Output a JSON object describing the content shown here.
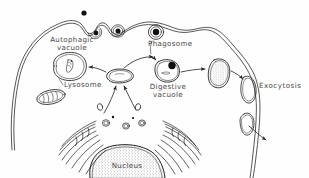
{
  "figure": {
    "kind": "hand-drawn biological diagram",
    "width": 309,
    "height": 178,
    "background_color": "#fefefe",
    "ink_color": "#1f1f1f"
  },
  "labels": {
    "autophagic_vacuole_line1": "Autophagic",
    "autophagic_vacuole_line2": "vacuole",
    "phagosome": "Phagosome",
    "lysosome": "Lysosome",
    "digestive_vacuole_line1": "Digestive",
    "digestive_vacuole_line2": "vacuole",
    "exocytosis": "Exocytosis",
    "nucleus": "Nucleus"
  },
  "structures": [
    {
      "name": "cell-membrane",
      "description": "irregular double-line plasma membrane bounding the cell"
    },
    {
      "name": "extracellular-particle",
      "description": "solid black dot outside the cell"
    },
    {
      "name": "membrane-invagination",
      "description": "membrane pocket enclosing a particle"
    },
    {
      "name": "pinching-vesicle",
      "description": "vesicle at the membrane containing a dark particle"
    },
    {
      "name": "phagosome-vesicle",
      "description": "internalized vesicle with dark particle"
    },
    {
      "name": "autophagic-vacuole",
      "description": "large oval vacuole enclosing a degraded organelle"
    },
    {
      "name": "mitochondrion",
      "description": "oval organelle with internal cristae"
    },
    {
      "name": "lysosome",
      "description": "small kidney-shaped central vesicle, hub of arrows"
    },
    {
      "name": "digestive-vacuole",
      "description": "vacuole containing a black particle being digested"
    },
    {
      "name": "residual-body",
      "description": "stippled oval of indigestible remains"
    },
    {
      "name": "exocytic-vesicle",
      "description": "vesicle fusing with plasma membrane to release contents"
    },
    {
      "name": "golgi-apparatus",
      "description": "stacked curved cisternae with budding vesicles"
    },
    {
      "name": "nucleus",
      "description": "large stippled body at the base of the cell"
    }
  ],
  "arrows": [
    {
      "name": "arrow-lysosome-to-autophagic",
      "from": "lysosome",
      "to": "autophagic-vacuole"
    },
    {
      "name": "arrow-lysosome-to-digestive",
      "from": "lysosome",
      "to": "digestive-vacuole"
    },
    {
      "name": "arrow-phagosome-to-digestive",
      "from": "phagosome-vesicle",
      "to": "digestive-vacuole"
    },
    {
      "name": "arrow-digestive-to-residual",
      "from": "digestive-vacuole",
      "to": "residual-body"
    },
    {
      "name": "arrow-residual-to-exocytosis",
      "from": "residual-body",
      "to": "exocytic-vesicle"
    },
    {
      "name": "arrow-golgi-to-lysosome-left",
      "from": "golgi-apparatus",
      "to": "lysosome"
    },
    {
      "name": "arrow-golgi-to-lysosome-right",
      "from": "golgi-apparatus",
      "to": "lysosome"
    },
    {
      "name": "arrow-secretion-out",
      "from": "exocytic-vesicle",
      "to": "extracellular-space"
    }
  ]
}
